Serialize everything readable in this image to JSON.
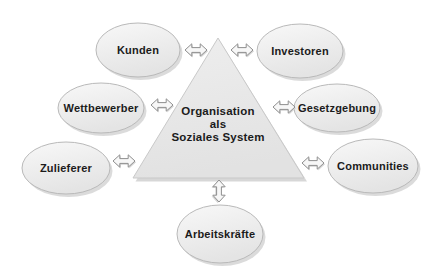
{
  "diagram": {
    "type": "stakeholder-environment-diagram",
    "center": {
      "shape": "triangle",
      "label": "Organisation als Soziales System",
      "label_lines": [
        "Organisation",
        "als",
        "Soziales System"
      ]
    },
    "nodes": [
      {
        "id": "kunden",
        "label": "Kunden",
        "position": "top-left"
      },
      {
        "id": "investoren",
        "label": "Investoren",
        "position": "top-right"
      },
      {
        "id": "wettbewerber",
        "label": "Wettbewerber",
        "position": "middle-left"
      },
      {
        "id": "gesetzgebung",
        "label": "Gesetzgebung",
        "position": "middle-right"
      },
      {
        "id": "zulieferer",
        "label": "Zulieferer",
        "position": "lower-left"
      },
      {
        "id": "communities",
        "label": "Communities",
        "position": "lower-right"
      },
      {
        "id": "arbeitskraefte",
        "label": "Arbeitskräfte",
        "position": "bottom-center"
      }
    ],
    "connector": {
      "icon": "double-headed-arrow"
    },
    "colors": {
      "background": "#ffffff",
      "shape_fill": "#e9e9e9",
      "shape_fill_light": "#f8f8f8",
      "shape_border": "#b9b9b9",
      "triangle_border": "#c9c9c9",
      "shadow": "#b0b0b0",
      "arrow_fill": "#f7f7f7",
      "arrow_stroke": "#8f8f8f",
      "text": "#1b1b1b"
    }
  }
}
